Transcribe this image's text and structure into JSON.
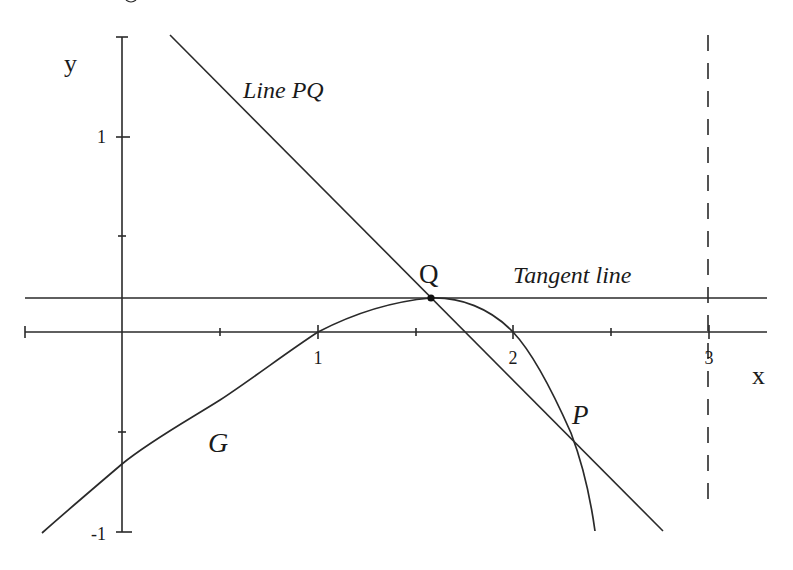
{
  "figure": {
    "axes": {
      "x_label": "x",
      "y_label": "y",
      "x_ticks": [
        {
          "value": 1,
          "label": "1"
        },
        {
          "value": 2,
          "label": "2"
        },
        {
          "value": 3,
          "label": "3"
        }
      ],
      "y_ticks": [
        {
          "value": 1,
          "label": "1"
        },
        {
          "value": -1,
          "label": "-1"
        }
      ],
      "minor_tick_step": 0.5
    },
    "labels": {
      "curve": "G",
      "secant": "Line PQ",
      "tangent": "Tangent line",
      "point_q": "Q",
      "point_p": "P"
    },
    "points": {
      "Q": {
        "x": 1.58,
        "y": 0.17
      },
      "P": {
        "x": 2.3,
        "y": -0.51
      }
    },
    "dashed_asymptote_x": 3,
    "colors": {
      "ink": "#2a2a2a",
      "background": "#ffffff"
    }
  }
}
